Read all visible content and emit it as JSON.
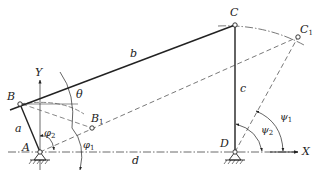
{
  "diagram": {
    "colors": {
      "ink": "#222222",
      "dashed": "#555555",
      "background": "#ffffff"
    },
    "points": {
      "A": {
        "label": "A",
        "x": 40,
        "y": 152
      },
      "B": {
        "label": "B",
        "x": 20,
        "y": 104
      },
      "B1": {
        "label": "B",
        "sub": "1",
        "x": 92,
        "y": 128
      },
      "C": {
        "label": "C",
        "x": 235,
        "y": 25
      },
      "C1": {
        "label": "C",
        "sub": "1",
        "x": 298,
        "y": 37
      },
      "D": {
        "label": "D",
        "x": 235,
        "y": 152
      }
    },
    "links": {
      "a": "a",
      "b": "b",
      "c": "c",
      "d": "d"
    },
    "axes": {
      "x": "X",
      "y": "Y"
    },
    "angles": {
      "theta": "θ",
      "phi1": {
        "sym": "φ",
        "sub": "1"
      },
      "phi2": {
        "sym": "φ",
        "sub": "2"
      },
      "psi1": {
        "sym": "ψ",
        "sub": "1"
      },
      "psi2": {
        "sym": "ψ",
        "sub": "2"
      }
    }
  }
}
